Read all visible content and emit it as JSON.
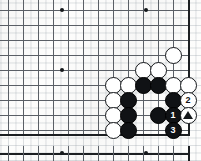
{
  "figure": {
    "kind": "go-board-diagram",
    "grid_spacing_px": 15,
    "board": {
      "origin_x": 8,
      "origin_y": 10,
      "cols": 13,
      "rows": 9,
      "right_edge_x": 188,
      "bottom_edge_y": 134,
      "line_color": "#5a5f66",
      "edge_color": "#1c1f22"
    },
    "lower_board": {
      "top_edge_y": 153,
      "origin_x": 8,
      "cols": 13,
      "tick_height_px": 7
    }
  },
  "star_points": [
    {
      "col": 0,
      "row": 0,
      "x": 62,
      "y": 10
    },
    {
      "col": 0,
      "row": 0,
      "x": 146,
      "y": 10
    },
    {
      "col": 0,
      "row": 0,
      "x": 62,
      "y": 70
    }
  ],
  "lower_star_points": [
    {
      "x": 62,
      "y": 153
    },
    {
      "x": 146,
      "y": 153
    }
  ],
  "stones": [
    {
      "color": "white",
      "x": 173,
      "y": 55,
      "label": "",
      "marker": ""
    },
    {
      "color": "white",
      "x": 143,
      "y": 70,
      "label": "",
      "marker": ""
    },
    {
      "color": "white",
      "x": 158,
      "y": 70,
      "label": "",
      "marker": ""
    },
    {
      "color": "white",
      "x": 113,
      "y": 85,
      "label": "",
      "marker": ""
    },
    {
      "color": "white",
      "x": 128,
      "y": 85,
      "label": "",
      "marker": ""
    },
    {
      "color": "black",
      "x": 143,
      "y": 85,
      "label": "",
      "marker": ""
    },
    {
      "color": "black",
      "x": 158,
      "y": 85,
      "label": "",
      "marker": ""
    },
    {
      "color": "white",
      "x": 173,
      "y": 85,
      "label": "",
      "marker": ""
    },
    {
      "color": "white",
      "x": 188,
      "y": 85,
      "label": "",
      "marker": ""
    },
    {
      "color": "white",
      "x": 113,
      "y": 100,
      "label": "",
      "marker": ""
    },
    {
      "color": "black",
      "x": 128,
      "y": 100,
      "label": "",
      "marker": ""
    },
    {
      "color": "black",
      "x": 173,
      "y": 100,
      "label": "",
      "marker": ""
    },
    {
      "color": "white",
      "x": 188,
      "y": 100,
      "label": "2",
      "marker": ""
    },
    {
      "color": "white",
      "x": 113,
      "y": 115,
      "label": "",
      "marker": ""
    },
    {
      "color": "black",
      "x": 128,
      "y": 115,
      "label": "",
      "marker": ""
    },
    {
      "color": "black",
      "x": 158,
      "y": 115,
      "label": "",
      "marker": ""
    },
    {
      "color": "black",
      "x": 173,
      "y": 115,
      "label": "1",
      "marker": ""
    },
    {
      "color": "white",
      "x": 188,
      "y": 115,
      "label": "",
      "marker": "triangle"
    },
    {
      "color": "white",
      "x": 113,
      "y": 130,
      "label": "",
      "marker": ""
    },
    {
      "color": "black",
      "x": 128,
      "y": 130,
      "label": "",
      "marker": ""
    },
    {
      "color": "black",
      "x": 173,
      "y": 130,
      "label": "3",
      "marker": ""
    }
  ],
  "move_labels": {
    "move_1": "1",
    "move_2": "2",
    "move_3": "3",
    "marked_stone": "triangle"
  }
}
